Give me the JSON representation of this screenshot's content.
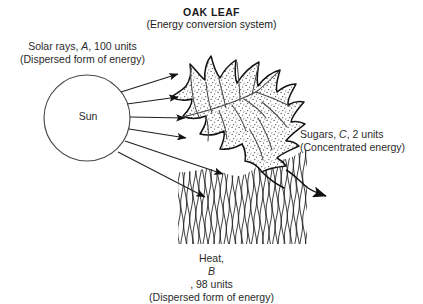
{
  "diagram": {
    "title": "OAK LEAF",
    "subtitle": "(Energy conversion system)",
    "input_label_line1": "Solar rays, ",
    "input_symbol": "A",
    "input_label_line1b": ", 100 units",
    "input_label_line2": "(Dispersed form of energy)",
    "source_label": "Sun",
    "output_label_line1": "Sugars, ",
    "output_symbol": "C",
    "output_label_line1b": ", 2 units",
    "output_label_line2": "(Concentrated energy)",
    "waste_label_line1": "Heat, ",
    "waste_symbol": "B",
    "waste_label_line1b": ", 98 units",
    "waste_label_line2": "(Dispersed form of energy)",
    "colors": {
      "ink": "#1a1a1a",
      "text": "#2b2b2b",
      "background": "#ffffff",
      "stipple": "#3a3a3a"
    },
    "icons": {
      "sun": "sun-circle-icon",
      "leaf": "oak-leaf-icon",
      "rays": "solar-ray-arrow-icon",
      "heat": "heat-wave-icon",
      "sugars": "sugar-output-arrow-icon"
    },
    "values": {
      "solar_input_units": 100,
      "sugars_output_units": 2,
      "heat_output_units": 98,
      "ray_arrow_count": 6
    }
  }
}
